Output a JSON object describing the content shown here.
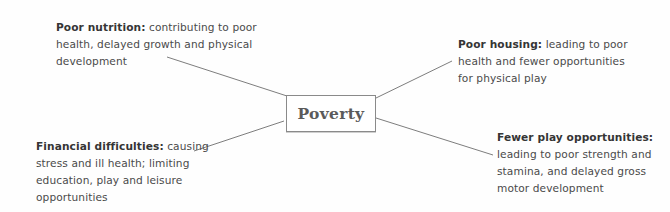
{
  "diagram": {
    "type": "mind-map",
    "center": {
      "label": "Poverty"
    },
    "nodes": [
      {
        "id": "nutrition",
        "position": "top-left",
        "label": "Poor nutrition:",
        "lines": [
          "contributing to poor",
          "health, delayed growth and physical",
          "development"
        ]
      },
      {
        "id": "housing",
        "position": "top-right",
        "label": "Poor housing:",
        "lines": [
          "leading to poor",
          "health and fewer opportunities",
          "for physical play"
        ]
      },
      {
        "id": "financial",
        "position": "bottom-left",
        "label": "Financial difficulties:",
        "lines": [
          "causing",
          "stress and ill health; limiting",
          "education, play and leisure",
          "opportunities"
        ]
      },
      {
        "id": "play",
        "position": "bottom-right",
        "label": "Fewer play opportunities:",
        "lines": [
          "",
          "leading to poor strength and",
          "stamina, and delayed gross",
          "motor development"
        ]
      }
    ],
    "colors": {
      "line": "#6e6e6e",
      "text": "#4a4a4a",
      "label": "#353535",
      "box_border": "#8a8a8a",
      "center_text": "#5a5a5a"
    }
  }
}
